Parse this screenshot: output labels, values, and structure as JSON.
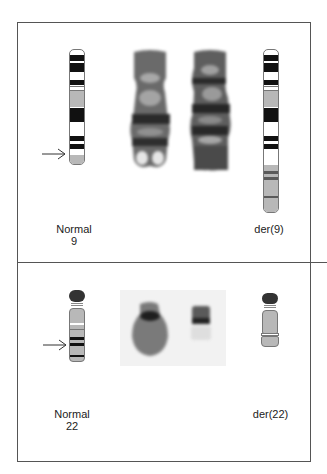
{
  "figure": {
    "panels": [
      {
        "id": "chr9",
        "left_label": {
          "line1": "Normal",
          "line2": "9"
        },
        "right_label": "der(9)"
      },
      {
        "id": "chr22",
        "left_label": {
          "line1": "Normal",
          "line2": "22"
        },
        "right_label": "der(22)"
      }
    ],
    "icons": [
      "arrow-right-icon",
      "arrow-right-icon"
    ],
    "colors": {
      "dark_band": "#111111",
      "grey_band": "#b8b8b8",
      "mid_band": "#5a5a5a",
      "border": "#555555"
    }
  }
}
